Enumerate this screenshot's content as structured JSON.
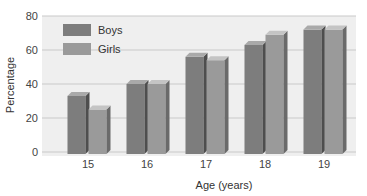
{
  "chart_data": {
    "type": "bar",
    "title": "",
    "xlabel": "Age (years)",
    "ylabel": "Percentage",
    "categories": [
      "15",
      "16",
      "17",
      "18",
      "19"
    ],
    "series": [
      {
        "name": "Boys",
        "values": [
          33,
          40,
          56,
          63,
          72
        ],
        "color": "#7d7d7d"
      },
      {
        "name": "Girls",
        "values": [
          25,
          40,
          54,
          69,
          72
        ],
        "color": "#9a9a9a"
      }
    ],
    "ylim": [
      0,
      80
    ],
    "yticks": [
      0,
      20,
      40,
      60,
      80
    ],
    "grid": true,
    "legend_position": "upper-left",
    "style": "3d-bars"
  },
  "legend": {
    "items": [
      {
        "label": "Boys"
      },
      {
        "label": "Girls"
      }
    ]
  },
  "axes": {
    "x_title": "Age (years)",
    "y_title": "Percentage",
    "y_ticks": [
      "0",
      "20",
      "40",
      "60",
      "80"
    ],
    "x_ticks": [
      "15",
      "16",
      "17",
      "18",
      "19"
    ]
  },
  "colors": {
    "plot_bg": "#efefef",
    "grid": "#c9c9c9",
    "boys_front": "#7d7d7d",
    "boys_side": "#4e4e4e",
    "boys_top": "#a9a9a9",
    "girls_front": "#9a9a9a",
    "girls_side": "#6a6a6a",
    "girls_top": "#c4c4c4"
  }
}
